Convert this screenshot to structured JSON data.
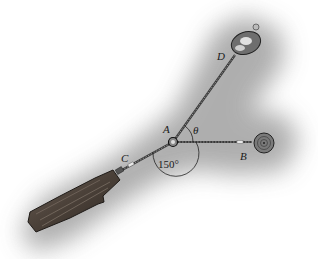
{
  "figure": {
    "labels": {
      "A": "A",
      "B": "B",
      "C": "C",
      "D": "D",
      "theta": "θ",
      "angle_AC_AB": "150°"
    },
    "colors": {
      "background": "#ffffff",
      "shadow": "#9a9a9a",
      "cable": "#3a3a3a",
      "log": "#4a4038",
      "text": "#1a1a1a"
    }
  }
}
